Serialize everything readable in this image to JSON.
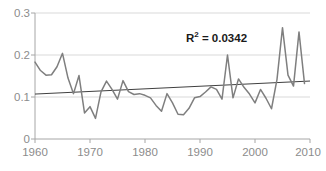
{
  "chart_data": {
    "type": "line",
    "title": "",
    "xlabel": "",
    "ylabel": "",
    "xlim": [
      1960,
      2010
    ],
    "ylim": [
      0,
      0.3
    ],
    "grid": true,
    "legend": false,
    "y_ticks": [
      "0.3",
      "0.2",
      "0.1",
      "0"
    ],
    "y_tick_values": [
      0.3,
      0.2,
      0.1,
      0
    ],
    "x_ticks": [
      "1960",
      "1970",
      "1980",
      "1990",
      "2000",
      "2010"
    ],
    "x_tick_values": [
      1960,
      1970,
      1980,
      1990,
      2000,
      2010
    ],
    "annotations": [
      {
        "name": "r-squared",
        "text": "R² = 0.0342",
        "text_base": "R",
        "text_sup": "2",
        "text_rest": " = 0.0342",
        "value": 0.0342
      }
    ],
    "series": [
      {
        "name": "data",
        "color": "#7f7f7f",
        "x": [
          1960,
          1961,
          1962,
          1963,
          1964,
          1965,
          1966,
          1967,
          1968,
          1969,
          1970,
          1971,
          1972,
          1973,
          1974,
          1975,
          1976,
          1977,
          1978,
          1979,
          1980,
          1981,
          1982,
          1983,
          1984,
          1985,
          1986,
          1987,
          1988,
          1989,
          1990,
          1991,
          1992,
          1993,
          1994,
          1995,
          1996,
          1997,
          1998,
          1999,
          2000,
          2001,
          2002,
          2003,
          2004,
          2005,
          2006,
          2007,
          2008,
          2009
        ],
        "values": [
          0.183,
          0.163,
          0.152,
          0.153,
          0.172,
          0.204,
          0.145,
          0.108,
          0.151,
          0.062,
          0.077,
          0.049,
          0.112,
          0.138,
          0.118,
          0.095,
          0.139,
          0.113,
          0.106,
          0.108,
          0.104,
          0.098,
          0.08,
          0.066,
          0.108,
          0.086,
          0.059,
          0.058,
          0.073,
          0.098,
          0.101,
          0.112,
          0.124,
          0.118,
          0.095,
          0.2,
          0.098,
          0.143,
          0.123,
          0.107,
          0.086,
          0.118,
          0.097,
          0.072,
          0.142,
          0.265,
          0.152,
          0.126,
          0.255,
          0.132
        ],
        "max": 0.265,
        "min": 0.049
      },
      {
        "name": "linear-trendline",
        "color": "#404040",
        "start": {
          "x": 1960,
          "y": 0.107
        },
        "end": {
          "x": 2010,
          "y": 0.138
        }
      }
    ]
  },
  "axes": {
    "y_axis_name": "y-axis",
    "x_axis_name": "x-axis"
  }
}
